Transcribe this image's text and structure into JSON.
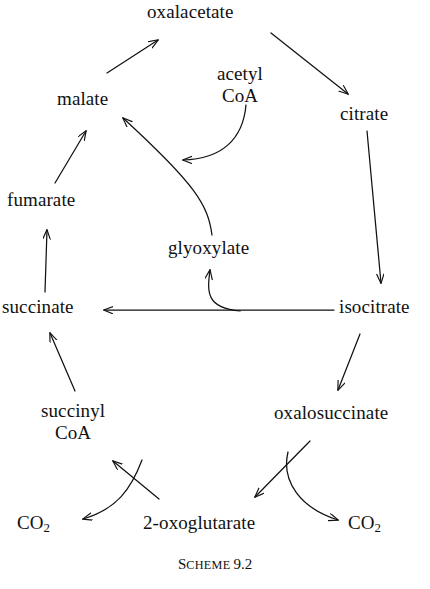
{
  "diagram": {
    "caption": {
      "label_lead": "S",
      "label_rest": "CHEME",
      "number": "9.2"
    },
    "ink_color": "#111111",
    "background_color": "#ffffff",
    "nodes": [
      {
        "id": "oxalacetate",
        "label": "oxalacetate"
      },
      {
        "id": "malate",
        "label": "malate"
      },
      {
        "id": "acetyl_coa",
        "line1": "acetyl",
        "line2": "CoA"
      },
      {
        "id": "citrate",
        "label": "citrate"
      },
      {
        "id": "fumarate",
        "label": "fumarate"
      },
      {
        "id": "glyoxylate",
        "label": "glyoxylate"
      },
      {
        "id": "succinate",
        "label": "succinate"
      },
      {
        "id": "isocitrate",
        "label": "isocitrate"
      },
      {
        "id": "succinyl_coa",
        "line1": "succinyl",
        "line2": "CoA"
      },
      {
        "id": "oxalosuccinate",
        "label": "oxalosuccinate"
      },
      {
        "id": "co2_left",
        "formula": "CO",
        "subscript": "2"
      },
      {
        "id": "oxoglutarate",
        "label": "2-oxoglutarate"
      },
      {
        "id": "co2_right",
        "formula": "CO",
        "subscript": "2"
      }
    ],
    "edges": [
      {
        "id": "malate-to-oxalacetate",
        "from": "malate",
        "to": "oxalacetate",
        "style": "straight"
      },
      {
        "id": "oxalacetate-to-citrate",
        "from": "oxalacetate",
        "to": "citrate",
        "style": "straight"
      },
      {
        "id": "citrate-to-isocitrate",
        "from": "citrate",
        "to": "isocitrate",
        "style": "straight"
      },
      {
        "id": "isocitrate-to-oxalosuccinate",
        "from": "isocitrate",
        "to": "oxalosuccinate",
        "style": "straight"
      },
      {
        "id": "oxalosuccinate-to-oxoglutarate",
        "from": "oxalosuccinate",
        "to": "oxoglutarate",
        "style": "straight"
      },
      {
        "id": "oxoglutarate-to-co2-right",
        "from": "oxoglutarate",
        "to": "co2_right",
        "style": "curved"
      },
      {
        "id": "oxoglutarate-to-succinyl-coa",
        "from": "oxoglutarate",
        "to": "succinyl_coa",
        "style": "straight"
      },
      {
        "id": "oxoglutarate-to-co2-left",
        "from": "oxoglutarate",
        "to": "co2_left",
        "style": "curved"
      },
      {
        "id": "succinyl-coa-to-succinate",
        "from": "succinyl_coa",
        "to": "succinate",
        "style": "straight"
      },
      {
        "id": "succinate-to-fumarate",
        "from": "succinate",
        "to": "fumarate",
        "style": "straight"
      },
      {
        "id": "fumarate-to-malate",
        "from": "fumarate",
        "to": "malate",
        "style": "straight"
      },
      {
        "id": "isocitrate-to-succinate",
        "from": "isocitrate",
        "to": "succinate",
        "style": "straight"
      },
      {
        "id": "isocitrate-to-glyoxylate",
        "from": "isocitrate",
        "to": "glyoxylate",
        "style": "curved"
      },
      {
        "id": "glyoxylate-to-malate",
        "from": "glyoxylate",
        "to": "malate",
        "style": "curved"
      },
      {
        "id": "acetyl-coa-to-malate-branch",
        "from": "acetyl_coa",
        "to": "glyoxylate-malate-branch",
        "style": "curved"
      }
    ]
  }
}
